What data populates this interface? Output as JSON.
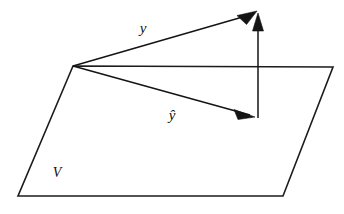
{
  "figure": {
    "background_color": "#ffffff",
    "stroke_color": "#141414",
    "width": 344,
    "height": 214
  },
  "labels": {
    "vector_y": "y",
    "vector_y_hat": "ŷ",
    "subspace": "V"
  },
  "plane": {
    "name": "subspace-plane",
    "label": "V",
    "points": "73,66 333,67 283,196 18,196"
  },
  "vectors": [
    {
      "name": "vector-y",
      "label": "y",
      "from_x": 73,
      "from_y": 66,
      "to_x": 256,
      "to_y": 13,
      "label_x": 148,
      "label_y": 32,
      "arrow_angle_deg": -16.2
    },
    {
      "name": "vector-y-hat",
      "label": "ŷ",
      "from_x": 73,
      "from_y": 66,
      "to_x": 253,
      "to_y": 116,
      "label_x": 167,
      "label_y": 118,
      "arrow_angle_deg": 15.5
    },
    {
      "name": "vector-residual",
      "label": "",
      "from_x": 258,
      "from_y": 118,
      "to_x": 258,
      "to_y": 14,
      "label_x": 0,
      "label_y": 0,
      "arrow_angle_deg": -90
    }
  ],
  "arrowheads": {
    "y_tip": "256,13 240,17 247,24",
    "y_hat_tip": "253,116 236,110 241,119",
    "residual_tip": "258,14 252,30 264,30"
  }
}
